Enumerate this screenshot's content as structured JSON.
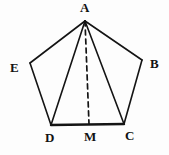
{
  "figure": {
    "kind": "pentagon-with-median-diagram",
    "background_color": "#fdfdfd",
    "stroke_color": "#141414",
    "labels": {
      "A": "A",
      "B": "B",
      "C": "C",
      "D": "D",
      "E": "E",
      "M": "M"
    },
    "points": {
      "A": {
        "x": 85,
        "y": 21
      },
      "B": {
        "x": 142,
        "y": 60
      },
      "C": {
        "x": 124,
        "y": 124
      },
      "D": {
        "x": 51,
        "y": 125
      },
      "E": {
        "x": 30,
        "y": 63
      },
      "M": {
        "x": 89,
        "y": 124
      }
    },
    "edges": [
      {
        "name": "edge-AB",
        "from": "A",
        "to": "B",
        "style": "solid",
        "width": 1.6
      },
      {
        "name": "edge-BC",
        "from": "B",
        "to": "C",
        "style": "solid",
        "width": 1.6
      },
      {
        "name": "edge-CD",
        "from": "C",
        "to": "D",
        "style": "solid",
        "width": 2.4
      },
      {
        "name": "edge-DE",
        "from": "D",
        "to": "E",
        "style": "solid",
        "width": 1.6
      },
      {
        "name": "edge-EA",
        "from": "E",
        "to": "A",
        "style": "solid",
        "width": 1.6
      },
      {
        "name": "diagonal-AD",
        "from": "A",
        "to": "D",
        "style": "solid",
        "width": 1.6
      },
      {
        "name": "diagonal-AC",
        "from": "A",
        "to": "C",
        "style": "solid",
        "width": 1.6
      },
      {
        "name": "median-AM",
        "from": "A",
        "to": "M",
        "style": "dashed",
        "width": 1.7,
        "dash": "5,4"
      }
    ]
  }
}
